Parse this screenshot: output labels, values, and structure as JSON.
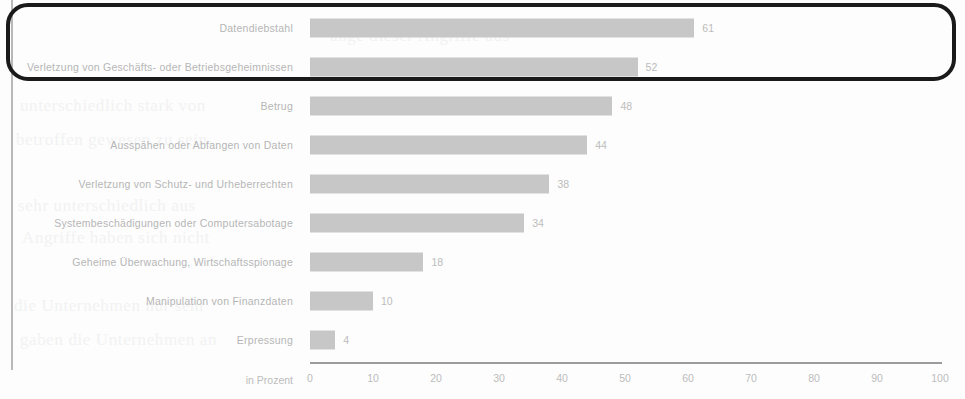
{
  "chart_data": {
    "type": "bar",
    "orientation": "horizontal",
    "title": "",
    "subtitle": "",
    "xlabel": "in Prozent",
    "ylabel": "",
    "xlim": [
      0,
      100
    ],
    "xticks": [
      "0",
      "10",
      "20",
      "30",
      "40",
      "50",
      "60",
      "70",
      "80",
      "90",
      "100"
    ],
    "grid": false,
    "legend": null,
    "bar_color": "#c7c7c7",
    "label_color": "#b6b6b6",
    "categories": [
      "Datendiebstahl",
      "Verletzung von Geschäfts- oder Betriebsgeheimnissen",
      "Betrug",
      "Ausspähen oder Abfangen von Daten",
      "Verletzung von Schutz- und Urheberrechten",
      "Systembeschädigungen oder Computersabotage",
      "Geheime Überwachung, Wirtschaftsspionage",
      "Manipulation von Finanzdaten",
      "Erpressung"
    ],
    "values": [
      61,
      52,
      48,
      44,
      38,
      34,
      18,
      10,
      4
    ],
    "value_labels": [
      "61",
      "52",
      "48",
      "44",
      "38",
      "34",
      "18",
      "10",
      "4"
    ]
  },
  "annotation": {
    "highlight_box": {
      "shape": "rounded-rectangle",
      "color": "#1a1a1a",
      "covers_categories": [
        "Datendiebstahl",
        "Verletzung von Geschäfts- oder Betriebsgeheimnissen"
      ]
    }
  },
  "background_ghost_text": {
    "lines": [
      "ange dieser Angriffe aus",
      "unterschiedlich stark von",
      "betroffen gewesen zu sein",
      "sehr unterschiedlich aus",
      "Angriffe haben sich nicht",
      "die Unternehmen nur sehr",
      "gaben die Unternehmen an"
    ]
  }
}
